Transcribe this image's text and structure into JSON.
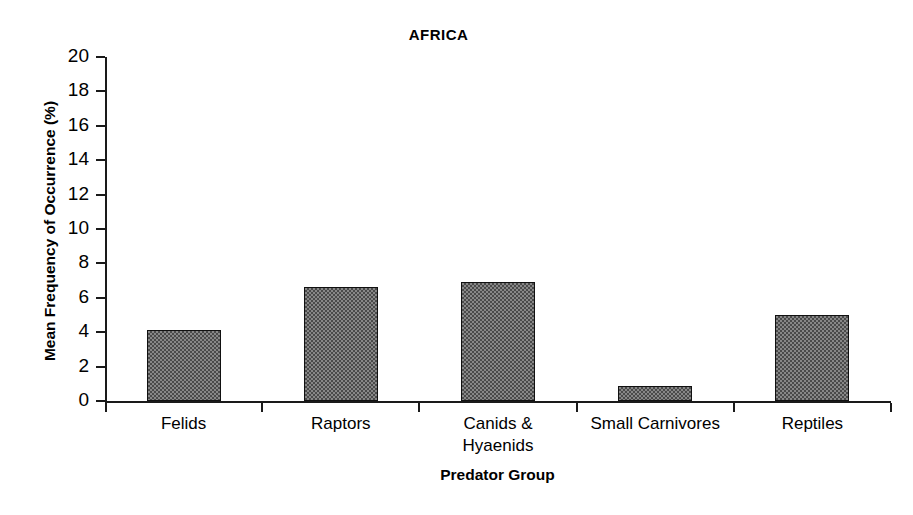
{
  "chart_data": {
    "type": "bar",
    "title": "AFRICA",
    "xlabel": "Predator Group",
    "ylabel": "Mean Frequency of Occurrence (%)",
    "categories": [
      "Felids",
      "Raptors",
      "Canids &\nHyaenids",
      "Small Carnivores",
      "Reptiles"
    ],
    "values": [
      4.1,
      6.6,
      6.9,
      0.85,
      5.0
    ],
    "ylim": [
      0,
      20
    ],
    "yticks": [
      0,
      2,
      4,
      6,
      8,
      10,
      12,
      14,
      16,
      18,
      20
    ],
    "ytick_labels": [
      "0",
      "2",
      "4",
      "6",
      "8",
      "10",
      "12",
      "14",
      "16",
      "18",
      "20"
    ],
    "grid": false,
    "legend": false,
    "bar_fill": "#878787",
    "bar_pattern": "checkerboard",
    "bar_edge_color": "#111111",
    "axis_color": "#1a1a1a",
    "background": "#ffffff"
  }
}
